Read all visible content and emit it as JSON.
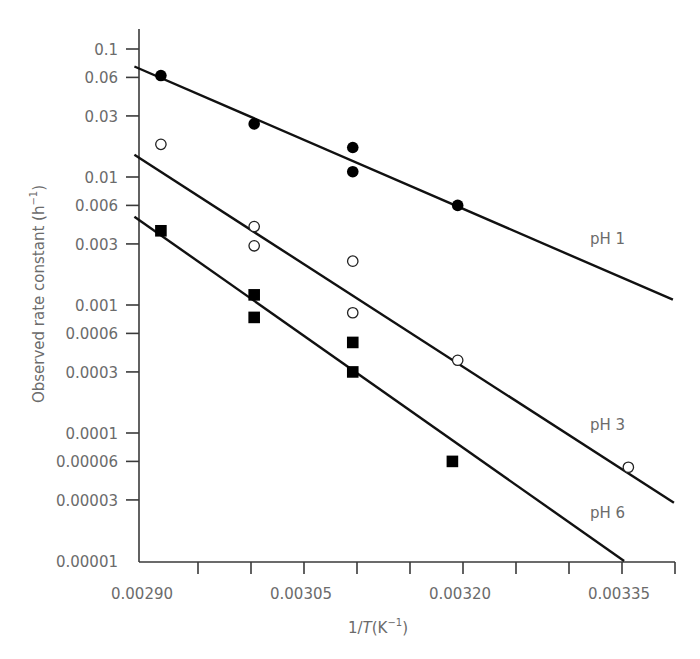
{
  "chart_data": {
    "type": "scatter",
    "title": "",
    "xlabel": "1/T(K⁻¹)",
    "xlabel_parts": {
      "prefix": "1/",
      "italic": "T",
      "suffix": "(K",
      "superscript": "−1",
      "close": ")"
    },
    "ylabel": "Observed rate constant (h⁻¹)",
    "ylabel_parts": {
      "main": "Observed rate constant (h",
      "superscript": "−1",
      "close": ")"
    },
    "yscale": "log",
    "xlim": [
      0.0029,
      0.0034
    ],
    "ylim": [
      1e-05,
      0.15
    ],
    "grid": false,
    "legend": "inline labels at right end of fit lines",
    "x_ticks": [
      0.0029,
      0.00295,
      0.003,
      0.00305,
      0.0031,
      0.00315,
      0.0032,
      0.00325,
      0.0033,
      0.00335,
      0.0034
    ],
    "x_tick_labels": [
      {
        "value": 0.0029,
        "label": "0.00290"
      },
      {
        "value": 0.00305,
        "label": "0.00305"
      },
      {
        "value": 0.0032,
        "label": "0.00320"
      },
      {
        "value": 0.00335,
        "label": "0.00335"
      }
    ],
    "y_ticks": [
      {
        "value": 0.1,
        "label": "0.1"
      },
      {
        "value": 0.06,
        "label": "0.06"
      },
      {
        "value": 0.03,
        "label": "0.03"
      },
      {
        "value": 0.01,
        "label": "0.01"
      },
      {
        "value": 0.006,
        "label": "0.006"
      },
      {
        "value": 0.003,
        "label": "0.003"
      },
      {
        "value": 0.001,
        "label": "0.001"
      },
      {
        "value": 0.0006,
        "label": "0.0006"
      },
      {
        "value": 0.0003,
        "label": "0.0003"
      },
      {
        "value": 0.0001,
        "label": "0.0001"
      },
      {
        "value": 6e-05,
        "label": "0.00006"
      },
      {
        "value": 3e-05,
        "label": "0.00003"
      },
      {
        "value": 1e-05,
        "label": "0.00001"
      }
    ],
    "series": [
      {
        "name": "pH 1",
        "marker": "filled-circle",
        "points": [
          {
            "x": 0.002915,
            "y": 0.062
          },
          {
            "x": 0.003003,
            "y": 0.026
          },
          {
            "x": 0.003096,
            "y": 0.017
          },
          {
            "x": 0.003096,
            "y": 0.011
          },
          {
            "x": 0.003195,
            "y": 0.006
          }
        ],
        "fit_line": {
          "x0": 0.00289,
          "y0": 0.073,
          "x1": 0.003398,
          "y1": 0.0011
        },
        "label_pos": {
          "x": 590,
          "y": 244
        }
      },
      {
        "name": "pH 3",
        "marker": "open-circle",
        "points": [
          {
            "x": 0.002915,
            "y": 0.018
          },
          {
            "x": 0.003003,
            "y": 0.0041
          },
          {
            "x": 0.003003,
            "y": 0.0029
          },
          {
            "x": 0.003096,
            "y": 0.0022
          },
          {
            "x": 0.003096,
            "y": 0.00087
          },
          {
            "x": 0.003195,
            "y": 0.00037
          },
          {
            "x": 0.003356,
            "y": 5.4e-05
          }
        ],
        "fit_line": {
          "x0": 0.00289,
          "y0": 0.0149,
          "x1": 0.003399,
          "y1": 2.85e-05
        },
        "label_pos": {
          "x": 590,
          "y": 430
        }
      },
      {
        "name": "pH 6",
        "marker": "filled-square",
        "points": [
          {
            "x": 0.002915,
            "y": 0.0038
          },
          {
            "x": 0.003003,
            "y": 0.0012
          },
          {
            "x": 0.003003,
            "y": 0.0008
          },
          {
            "x": 0.003096,
            "y": 0.00051
          },
          {
            "x": 0.003096,
            "y": 0.0003
          },
          {
            "x": 0.00319,
            "y": 6e-05
          }
        ],
        "fit_line": {
          "x0": 0.00289,
          "y0": 0.0049,
          "x1": 0.003352,
          "y1": 1e-05
        },
        "label_pos": {
          "x": 590,
          "y": 518
        }
      }
    ]
  },
  "layout": {
    "plot_left": 139,
    "plot_right": 675,
    "plot_top": 29,
    "plot_bottom": 562,
    "x_zero_value": 0.0029,
    "x_zero_px": 145,
    "x_px_per_unit": 1060000,
    "y_ref_value": 0.1,
    "y_ref_px": 49,
    "y_px_per_decade": 128
  }
}
